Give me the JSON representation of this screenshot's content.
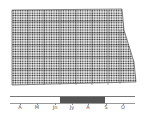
{
  "map": {
    "title": "",
    "pattern": "stippled dots",
    "fill_color": "#222222",
    "background": "#ffffff"
  },
  "timeline": {
    "months": [
      "A",
      "M",
      "Jn",
      "Jy",
      "A",
      "S",
      "O"
    ],
    "highlight_start": "Jn",
    "highlight_end": "A",
    "highlight_color": "#555555"
  }
}
